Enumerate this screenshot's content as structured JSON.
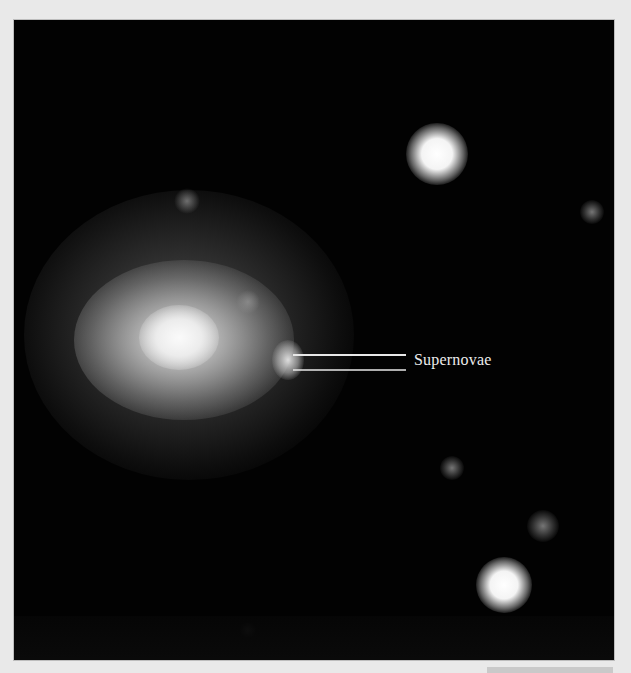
{
  "image": {
    "subject": "galaxy with supernova",
    "annotation": {
      "label": "Supernovae",
      "pointer_lines": 2
    },
    "colors": {
      "background": "#e9e9e9",
      "sky": "#020202",
      "label": "#ececec"
    }
  }
}
